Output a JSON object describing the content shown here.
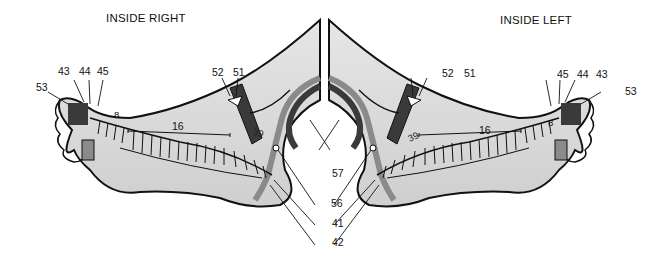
{
  "titles": {
    "right": "INSIDE RIGHT",
    "left": "INSIDE LEFT"
  },
  "right_foot": {
    "labels": {
      "l53": "53",
      "l43": "43",
      "l44": "44",
      "l45": "45",
      "l8": "8",
      "l16": "16",
      "l52": "52",
      "l51": "51",
      "l39": "39"
    }
  },
  "left_foot": {
    "labels": {
      "l53": "53",
      "l43": "43",
      "l44": "44",
      "l45": "45",
      "l8": "8",
      "l16": "16",
      "l52": "52",
      "l51": "51",
      "l39": "39"
    }
  },
  "center_labels": {
    "l57": "57",
    "l56": "56",
    "l41": "41",
    "l42": "42"
  },
  "colors": {
    "foot_fill": "#d9d9d9",
    "outline": "#111111",
    "dark_band": "#3a3a3a",
    "mid_band": "#8a8a8a",
    "background": "#ffffff"
  }
}
